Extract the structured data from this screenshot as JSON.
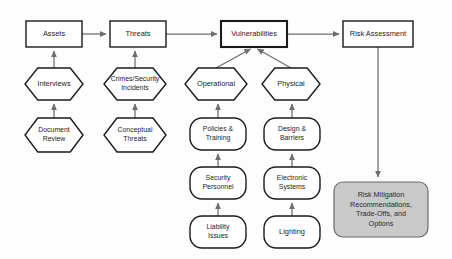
{
  "diagram": {
    "background_color": "#fdfdfd",
    "line_color": "#6e6e6e",
    "stroke_color": "#1a1a1a",
    "shaded_fill": "#c9c9c9",
    "nodes": [
      {
        "id": "assets",
        "label": "Assets",
        "lines": [
          "Assets"
        ],
        "shape": "rectangle",
        "x": 26,
        "y": 21,
        "w": 56,
        "h": 26,
        "emphasis": "normal"
      },
      {
        "id": "threats",
        "label": "Threats",
        "lines": [
          "Threats"
        ],
        "shape": "rectangle",
        "x": 110,
        "y": 21,
        "w": 56,
        "h": 26,
        "emphasis": "normal"
      },
      {
        "id": "vulnerabilities",
        "label": "Vulnerabilities",
        "lines": [
          "Vulnerabilities"
        ],
        "shape": "rectangle",
        "x": 221,
        "y": 21,
        "w": 66,
        "h": 26,
        "emphasis": "bold"
      },
      {
        "id": "risk-assessment",
        "label": "Risk Assessment",
        "lines": [
          "Risk Assessment"
        ],
        "shape": "rectangle",
        "x": 343,
        "y": 21,
        "w": 70,
        "h": 26,
        "emphasis": "normal"
      },
      {
        "id": "interviews",
        "label": "Interviews",
        "lines": [
          "Interviews"
        ],
        "shape": "hexagon",
        "x": 25,
        "y": 68,
        "w": 58,
        "h": 32,
        "emphasis": "normal"
      },
      {
        "id": "crimes-security-incidents",
        "label": "Crimes/Security Incidents",
        "lines": [
          "Crimes/Security",
          "Incidents"
        ],
        "shape": "hexagon",
        "x": 104,
        "y": 68,
        "w": 62,
        "h": 32,
        "emphasis": "normal"
      },
      {
        "id": "operational",
        "label": "Operational",
        "lines": [
          "Operational"
        ],
        "shape": "hexagon",
        "x": 185,
        "y": 68,
        "w": 62,
        "h": 32,
        "emphasis": "normal"
      },
      {
        "id": "physical",
        "label": "Physical",
        "lines": [
          "Physical"
        ],
        "shape": "hexagon",
        "x": 262,
        "y": 68,
        "w": 58,
        "h": 32,
        "emphasis": "normal"
      },
      {
        "id": "document-review",
        "label": "Document Review",
        "lines": [
          "Document",
          "Review"
        ],
        "shape": "hexagon",
        "x": 25,
        "y": 118,
        "w": 58,
        "h": 34,
        "emphasis": "normal"
      },
      {
        "id": "conceptual-threats",
        "label": "Conceptual Threats",
        "lines": [
          "Conceptual",
          "Threats"
        ],
        "shape": "hexagon",
        "x": 104,
        "y": 118,
        "w": 62,
        "h": 34,
        "emphasis": "normal"
      },
      {
        "id": "policies-training",
        "label": "Policies & Training",
        "lines": [
          "Policies &",
          "Training"
        ],
        "shape": "rounded",
        "x": 190,
        "y": 118,
        "w": 56,
        "h": 32,
        "emphasis": "normal"
      },
      {
        "id": "design-barriers",
        "label": "Design & Barriers",
        "lines": [
          "Design &",
          "Barriers"
        ],
        "shape": "rounded",
        "x": 264,
        "y": 118,
        "w": 56,
        "h": 32,
        "emphasis": "normal"
      },
      {
        "id": "security-personnel",
        "label": "Security Personnel",
        "lines": [
          "Security",
          "Personnel"
        ],
        "shape": "rounded",
        "x": 190,
        "y": 167,
        "w": 56,
        "h": 32,
        "emphasis": "normal"
      },
      {
        "id": "electronic-systems",
        "label": "Electronic Systems",
        "lines": [
          "Electronic",
          "Systems"
        ],
        "shape": "rounded",
        "x": 264,
        "y": 167,
        "w": 56,
        "h": 32,
        "emphasis": "normal"
      },
      {
        "id": "liability-issues",
        "label": "Liability Issues",
        "lines": [
          "Liability",
          "Issues"
        ],
        "shape": "rounded",
        "x": 190,
        "y": 216,
        "w": 56,
        "h": 32,
        "emphasis": "normal"
      },
      {
        "id": "lighting",
        "label": "Lighting",
        "lines": [
          "Lighting"
        ],
        "shape": "rounded",
        "x": 264,
        "y": 216,
        "w": 56,
        "h": 32,
        "emphasis": "normal"
      },
      {
        "id": "risk-mitigation",
        "label": "Risk Mitigation Recommendations, Trade-Offs, and Options",
        "lines": [
          "Risk Mitigation",
          "Recommendations,",
          "Trade-Offs, and",
          "Options"
        ],
        "shape": "rounded-shaded",
        "x": 334,
        "y": 182,
        "w": 94,
        "h": 55,
        "emphasis": "shaded"
      }
    ],
    "connections": [
      {
        "id": "assets-to-threats",
        "from": "assets",
        "to": "threats",
        "kind": "arrow-right"
      },
      {
        "id": "threats-to-vulnerabilities",
        "from": "threats",
        "to": "vulnerabilities",
        "kind": "arrow-right"
      },
      {
        "id": "vulnerabilities-to-risk-assessment",
        "from": "vulnerabilities",
        "to": "risk-assessment",
        "kind": "arrow-right"
      },
      {
        "id": "interviews-to-assets",
        "from": "interviews",
        "to": "assets",
        "kind": "arrow-up"
      },
      {
        "id": "document-review-to-interviews",
        "from": "document-review",
        "to": "interviews",
        "kind": "arrow-up"
      },
      {
        "id": "crimes-to-threats",
        "from": "crimes-security-incidents",
        "to": "threats",
        "kind": "arrow-up"
      },
      {
        "id": "conceptual-to-crimes",
        "from": "conceptual-threats",
        "to": "crimes-security-incidents",
        "kind": "arrow-up"
      },
      {
        "id": "operational-to-vulnerabilities",
        "from": "operational",
        "to": "vulnerabilities",
        "kind": "arrow-diagonal"
      },
      {
        "id": "physical-to-vulnerabilities",
        "from": "physical",
        "to": "vulnerabilities",
        "kind": "arrow-diagonal"
      },
      {
        "id": "policies-to-operational",
        "from": "policies-training",
        "to": "operational",
        "kind": "arrow-up"
      },
      {
        "id": "security-personnel-to-policies",
        "from": "security-personnel",
        "to": "policies-training",
        "kind": "arrow-up"
      },
      {
        "id": "liability-to-security-personnel",
        "from": "liability-issues",
        "to": "security-personnel",
        "kind": "arrow-up"
      },
      {
        "id": "design-to-physical",
        "from": "design-barriers",
        "to": "physical",
        "kind": "arrow-up"
      },
      {
        "id": "electronic-to-design",
        "from": "electronic-systems",
        "to": "design-barriers",
        "kind": "arrow-up"
      },
      {
        "id": "lighting-to-electronic",
        "from": "lighting",
        "to": "electronic-systems",
        "kind": "arrow-up"
      },
      {
        "id": "risk-assessment-to-mitigation",
        "from": "risk-assessment",
        "to": "risk-mitigation",
        "kind": "arrow-down"
      }
    ]
  }
}
